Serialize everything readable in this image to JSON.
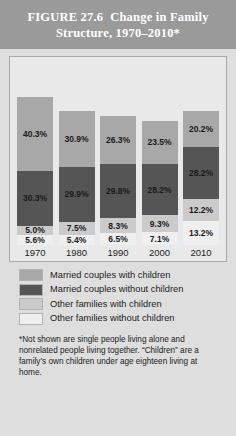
{
  "header": {
    "figure_number": "FIGURE 27.6",
    "title": "Change in Family Structure, 1970–2010*"
  },
  "chart_data": {
    "type": "bar",
    "stacked": true,
    "title": "Change in Family Structure, 1970–2010*",
    "xlabel": "",
    "ylabel": "",
    "ylim": [
      0,
      100
    ],
    "grid": false,
    "legend_position": "below",
    "categories": [
      "1970",
      "1980",
      "1990",
      "2000",
      "2010"
    ],
    "series": [
      {
        "name": "Married couples with children",
        "color": "#a8a8a8",
        "values": [
          40.3,
          30.9,
          26.3,
          23.5,
          20.2
        ],
        "labels": [
          "40.3%",
          "30.9%",
          "26.3%",
          "23.5%",
          "20.2%"
        ]
      },
      {
        "name": "Married couples without children",
        "color": "#555555",
        "values": [
          30.3,
          29.9,
          29.8,
          28.2,
          28.2
        ],
        "labels": [
          "30.3%",
          "29.9%",
          "29.8%",
          "28.2%",
          "28.2%"
        ]
      },
      {
        "name": "Other families with children",
        "color": "#cbcbcb",
        "values": [
          5.0,
          7.5,
          8.3,
          9.3,
          12.2
        ],
        "labels": [
          "5.0%",
          "7.5%",
          "8.3%",
          "9.3%",
          "12.2%"
        ]
      },
      {
        "name": "Other families without children",
        "color": "#efefef",
        "values": [
          5.6,
          5.4,
          6.5,
          7.1,
          13.2
        ],
        "labels": [
          "5.6%",
          "5.4%",
          "6.5%",
          "7.1%",
          "13.2%"
        ]
      }
    ]
  },
  "legend": [
    {
      "label": "Married couples with children",
      "color": "#a8a8a8"
    },
    {
      "label": "Married couples without children",
      "color": "#555555"
    },
    {
      "label": "Other families with children",
      "color": "#cbcbcb"
    },
    {
      "label": "Other families without children",
      "color": "#efefef"
    }
  ],
  "footnote": "*Not shown are single people living alone and nonrelated people living together. “Children” are a family’s own children under age eighteen living at home."
}
